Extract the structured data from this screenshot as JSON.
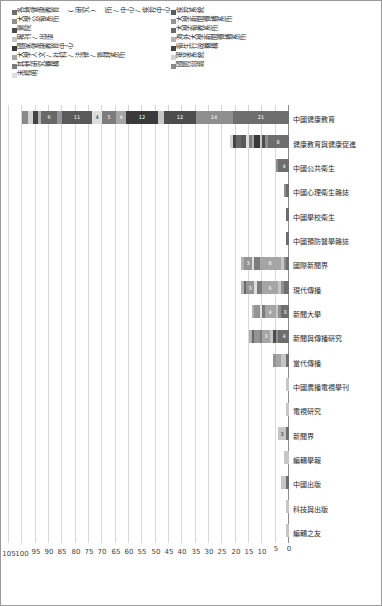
{
  "chart_data": {
    "type": "bar",
    "orientation": "vertical-stacked",
    "title": "",
    "xlabel": "",
    "ylabel": "",
    "ylim": [
      0,
      105
    ],
    "ytick_step": 5,
    "yticks": [
      0,
      5,
      10,
      15,
      20,
      25,
      30,
      35,
      40,
      45,
      50,
      55,
      60,
      65,
      70,
      75,
      80,
      85,
      90,
      95,
      100,
      105
    ],
    "grid": true,
    "legend_position": "right",
    "categories": [
      "編輯之友",
      "科技與出版",
      "中國出版",
      "編輯學報",
      "新聞界",
      "電視研究",
      "中國廣播電視學刊",
      "當代傳播",
      "新聞與傳播研究",
      "新聞大學",
      "現代傳播",
      "國際新聞界",
      "中國預防醫學雜誌",
      "中國學校衛生",
      "中國心理衛生雜誌",
      "中國公共衛生",
      "健康教育與健康促進",
      "中國健康教育"
    ],
    "series": [
      {
        "name": "各地健康教育 (研究) 所/中心/疾控中心/疾控中心",
        "color": "#6e6e6e",
        "values": [
          0,
          0,
          1,
          0,
          1,
          0,
          0,
          1,
          4,
          3,
          2,
          1,
          1,
          1,
          1,
          4,
          8,
          21
        ]
      },
      {
        "name": "大學公衛系所",
        "color": "#8f8f8f",
        "values": [
          0,
          0,
          0,
          0,
          0,
          0,
          0,
          0,
          1,
          1,
          1,
          1,
          0,
          0,
          1,
          1,
          1,
          14
        ]
      },
      {
        "name": "醫院",
        "color": "#4d4d4d",
        "values": [
          0,
          0,
          0,
          0,
          0,
          0,
          0,
          0,
          1,
          0,
          0,
          0,
          0,
          0,
          0,
          0,
          1,
          12
        ]
      },
      {
        "name": "報刊/出版",
        "color": "#c6c6c6",
        "values": [
          1,
          1,
          2,
          2,
          3,
          1,
          1,
          2,
          1,
          1,
          1,
          1,
          0,
          0,
          0,
          0,
          1,
          2
        ]
      },
      {
        "name": "國家健康教育中心",
        "color": "#3a3a3a",
        "values": [
          0,
          0,
          0,
          0,
          0,
          0,
          0,
          0,
          0,
          0,
          0,
          0,
          0,
          0,
          0,
          0,
          2,
          12
        ]
      },
      {
        "name": "大學人文/社科/法律/管理系所",
        "color": "#a5a5a5",
        "values": [
          0,
          0,
          0,
          0,
          0,
          0,
          0,
          2,
          3,
          4,
          6,
          8,
          0,
          0,
          0,
          0,
          1,
          4
        ]
      },
      {
        "name": "其他研究機構",
        "color": "#7c7c7c",
        "values": [
          0,
          0,
          0,
          0,
          0,
          0,
          0,
          0,
          1,
          1,
          2,
          2,
          0,
          0,
          0,
          0,
          1,
          5
        ]
      },
      {
        "name": "未標明",
        "color": "#dedede",
        "values": [
          0,
          0,
          0,
          0,
          0,
          0,
          0,
          0,
          0,
          1,
          1,
          1,
          0,
          0,
          0,
          0,
          1,
          4
        ]
      },
      {
        "name": "疾控系統",
        "color": "#5a5a5a",
        "values": [
          0,
          0,
          0,
          0,
          0,
          0,
          0,
          0,
          0,
          0,
          0,
          0,
          0,
          0,
          0,
          0,
          2,
          11
        ]
      },
      {
        "name": "大學新聞傳播系所",
        "color": "#949494",
        "values": [
          0,
          0,
          0,
          0,
          0,
          0,
          0,
          1,
          2,
          2,
          3,
          3,
          0,
          0,
          0,
          0,
          0,
          2
        ]
      },
      {
        "name": "大學衛教系所",
        "color": "#686868",
        "values": [
          0,
          0,
          0,
          0,
          0,
          0,
          0,
          0,
          1,
          0,
          1,
          0,
          0,
          0,
          0,
          0,
          2,
          6
        ]
      },
      {
        "name": "海外大學新聞傳播系所",
        "color": "#b2b2b2",
        "values": [
          0,
          0,
          0,
          0,
          0,
          0,
          0,
          0,
          1,
          1,
          1,
          1,
          0,
          0,
          0,
          0,
          0,
          1
        ]
      },
      {
        "name": "衛生行政機構",
        "color": "#444444",
        "values": [
          0,
          0,
          0,
          0,
          0,
          0,
          0,
          0,
          0,
          0,
          0,
          0,
          0,
          0,
          0,
          0,
          1,
          2
        ]
      },
      {
        "name": "軍某系統",
        "color": "#d2d2d2",
        "values": [
          0,
          0,
          0,
          0,
          0,
          0,
          0,
          0,
          0,
          0,
          0,
          0,
          0,
          0,
          0,
          0,
          1,
          2
        ]
      },
      {
        "name": "國際組織",
        "color": "#8a8a8a",
        "values": [
          0,
          0,
          0,
          0,
          0,
          0,
          0,
          0,
          0,
          0,
          0,
          0,
          0,
          0,
          0,
          0,
          0,
          2
        ]
      }
    ]
  },
  "axis": {
    "ticks": [
      "0",
      "5",
      "10",
      "15",
      "20",
      "25",
      "30",
      "35",
      "40",
      "45",
      "50",
      "55",
      "60",
      "65",
      "70",
      "75",
      "80",
      "85",
      "90",
      "95",
      "100",
      "105"
    ]
  },
  "legend": {
    "entries": [
      {
        "label": "各地健康教育 (研究) 所/中心/疾控中心",
        "color": "#6e6e6e"
      },
      {
        "label": "大學公衛系所",
        "color": "#8f8f8f"
      },
      {
        "label": "醫院",
        "color": "#4d4d4d"
      },
      {
        "label": "報刊/出版",
        "color": "#c6c6c6"
      },
      {
        "label": "國家健康教育中心",
        "color": "#3a3a3a"
      },
      {
        "label": "大學人文/社科/法律/管理系所",
        "color": "#a5a5a5"
      },
      {
        "label": "其他研究機構",
        "color": "#7c7c7c"
      },
      {
        "label": "未標明",
        "color": "#dedede"
      },
      {
        "label": "疾控系統",
        "color": "#5a5a5a"
      },
      {
        "label": "大學新聞傳播系所",
        "color": "#949494"
      },
      {
        "label": "大學衛教系所",
        "color": "#686868"
      },
      {
        "label": "海外大學新聞傳播系所",
        "color": "#b2b2b2"
      },
      {
        "label": "衛生行政機構",
        "color": "#444444"
      },
      {
        "label": "軍某系統",
        "color": "#d2d2d2"
      },
      {
        "label": "國際組織",
        "color": "#8a8a8a"
      }
    ]
  },
  "bar_segment_labels": {
    "note": "numeric data labels printed inside larger segments",
    "visible_values": [
      "1",
      "2",
      "3",
      "4",
      "5",
      "6",
      "8",
      "11",
      "12",
      "14",
      "21"
    ]
  }
}
